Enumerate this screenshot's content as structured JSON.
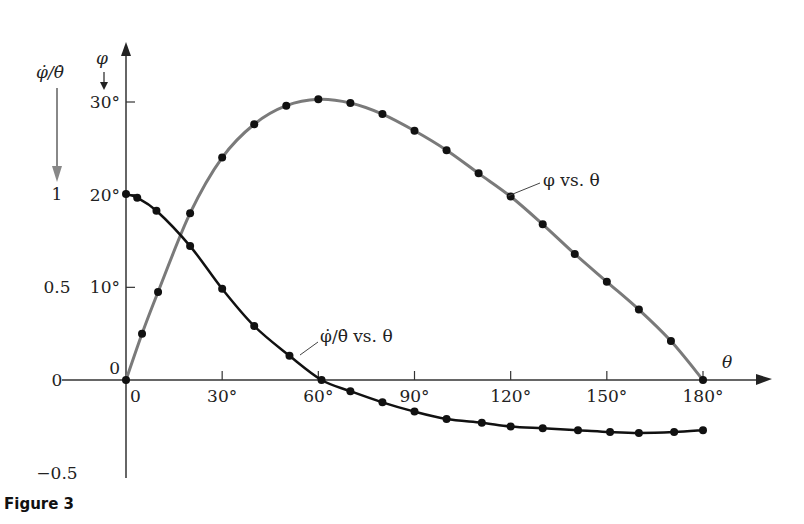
{
  "chart_data": {
    "type": "line",
    "title": "",
    "figure_caption": "Figure 3",
    "xlabel": "θ",
    "ylabel_left_outer": "φ̇/θ̇",
    "ylabel_left_inner": "φ",
    "xlim": [
      0,
      180
    ],
    "ylim_phi_deg": [
      0,
      30
    ],
    "ylim_ratio": [
      -0.5,
      1
    ],
    "x_ticks": [
      {
        "value": 0,
        "label": "0"
      },
      {
        "value": 30,
        "label": "30°"
      },
      {
        "value": 60,
        "label": "60°"
      },
      {
        "value": 90,
        "label": "90°"
      },
      {
        "value": 120,
        "label": "120°"
      },
      {
        "value": 150,
        "label": "150°"
      },
      {
        "value": 180,
        "label": "180°"
      }
    ],
    "y_ticks_phi": [
      {
        "value": 0,
        "label": "0"
      },
      {
        "value": 10,
        "label": "10°"
      },
      {
        "value": 20,
        "label": "20°"
      },
      {
        "value": 30,
        "label": "30°"
      }
    ],
    "y_ticks_ratio": [
      {
        "value": 1,
        "label": "1"
      },
      {
        "value": 0.5,
        "label": "0.5"
      },
      {
        "value": 0,
        "label": "0"
      },
      {
        "value": -0.5,
        "label": "−0.5"
      }
    ],
    "grid": false,
    "series": [
      {
        "name": "φ vs. θ",
        "axis": "phi_deg",
        "color": "#7a7a7a",
        "label_text": "φ vs. θ",
        "points": [
          [
            0,
            0
          ],
          [
            5,
            5.0
          ],
          [
            10,
            9.5
          ],
          [
            20,
            18.0
          ],
          [
            30,
            24.0
          ],
          [
            40,
            27.6
          ],
          [
            50,
            29.6
          ],
          [
            60,
            30.3
          ],
          [
            70,
            29.9
          ],
          [
            80,
            28.7
          ],
          [
            90,
            26.9
          ],
          [
            100,
            24.8
          ],
          [
            110,
            22.3
          ],
          [
            120,
            19.8
          ],
          [
            130,
            16.8
          ],
          [
            140,
            13.6
          ],
          [
            150,
            10.6
          ],
          [
            160,
            7.6
          ],
          [
            170,
            4.2
          ],
          [
            180,
            0
          ]
        ]
      },
      {
        "name": "φ̇/θ̇ vs. θ",
        "axis": "ratio",
        "color": "#111111",
        "label_text": "φ̇/θ̇ vs. θ",
        "points": [
          [
            0,
            1.0
          ],
          [
            3.5,
            0.98
          ],
          [
            9.5,
            0.91
          ],
          [
            20,
            0.72
          ],
          [
            30,
            0.49
          ],
          [
            40,
            0.29
          ],
          [
            51,
            0.13
          ],
          [
            61,
            0.0
          ],
          [
            70,
            -0.06
          ],
          [
            80,
            -0.12
          ],
          [
            90,
            -0.17
          ],
          [
            100,
            -0.21
          ],
          [
            111,
            -0.23
          ],
          [
            120,
            -0.25
          ],
          [
            130,
            -0.26
          ],
          [
            141,
            -0.27
          ],
          [
            151,
            -0.28
          ],
          [
            160,
            -0.285
          ],
          [
            171,
            -0.28
          ],
          [
            180,
            -0.27
          ]
        ]
      }
    ]
  }
}
